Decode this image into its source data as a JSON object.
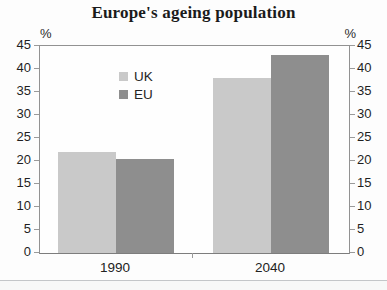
{
  "chart_data": {
    "type": "bar",
    "title": "Europe's ageing population",
    "categories": [
      "1990",
      "2040"
    ],
    "series": [
      {
        "name": "UK",
        "color": "#c9c9c9",
        "values": [
          22,
          38
        ]
      },
      {
        "name": "EU",
        "color": "#8e8e8e",
        "values": [
          20.5,
          43
        ]
      }
    ],
    "y_unit": "%",
    "ylim": [
      0,
      45
    ],
    "yticks": [
      45,
      40,
      35,
      30,
      25,
      20,
      15,
      10,
      5,
      0
    ],
    "grid": false,
    "legend_position": "upper-left-inside",
    "axis_labels_both_sides": true
  },
  "colors": {
    "uk_bar": "#c9c9c9",
    "eu_bar": "#8e8e8e",
    "frame": "#929292",
    "text": "#1f1f1f",
    "bottom_rule": "#c3c6c9"
  }
}
